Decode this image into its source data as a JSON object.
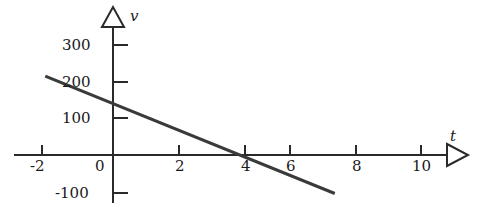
{
  "chart_data": {
    "type": "line",
    "title": "",
    "xlabel": "t",
    "ylabel": "v",
    "xlim": [
      -2.8,
      11.4
    ],
    "ylim": [
      -130,
      340
    ],
    "grid": false,
    "legend": null,
    "axis_style": "arrowed-open-triangle",
    "x_ticks": [
      -2,
      0,
      2,
      4,
      6,
      8,
      10
    ],
    "x_tick_labels": [
      "-2",
      "0",
      "2",
      "4",
      "6",
      "8",
      "10"
    ],
    "y_ticks": [
      -100,
      0,
      100,
      200,
      300
    ],
    "y_tick_labels": [
      "-100",
      "0",
      "100",
      "200",
      "300"
    ],
    "series": [
      {
        "name": "v(t)",
        "points": [
          {
            "t": -2.2,
            "v": 215
          },
          {
            "t": 7.2,
            "v": -105
          }
        ],
        "intercept_v": 150,
        "intercept_t": 4.4,
        "slope": -34,
        "color": "#3a3a3a",
        "width": 3
      }
    ]
  },
  "axes": {
    "vertical_label": "v",
    "horizontal_label": "t"
  },
  "colors": {
    "background": "#ffffff",
    "axis": "#2a2a2a",
    "line": "#3a3a3a",
    "text": "#1a1a1a"
  }
}
